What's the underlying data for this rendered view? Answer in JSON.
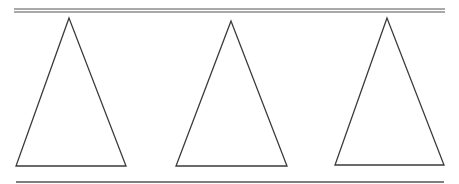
{
  "diagram": {
    "stroke_color": "#3a3a3a",
    "top_rule": {
      "x1": 14,
      "x2": 445,
      "y_upper": 9,
      "y_lower": 12
    },
    "bottom_rule": {
      "x1": 16,
      "x2": 444,
      "y": 182
    },
    "triangles": [
      {
        "id": "triangle-1",
        "apex": [
          69,
          18
        ],
        "base_left": [
          16,
          166
        ],
        "base_right": [
          126,
          166
        ]
      },
      {
        "id": "triangle-2",
        "apex": [
          231,
          21
        ],
        "base_left": [
          176,
          166
        ],
        "base_right": [
          287,
          166
        ]
      },
      {
        "id": "triangle-3",
        "apex": [
          387,
          18
        ],
        "base_left": [
          335,
          165
        ],
        "base_right": [
          444,
          165
        ]
      }
    ]
  }
}
